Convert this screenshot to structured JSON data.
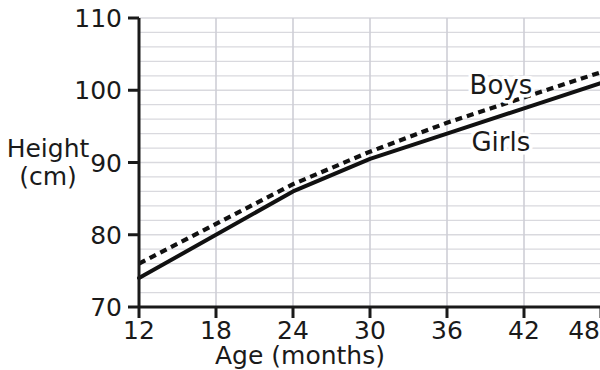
{
  "chart_data": {
    "type": "line",
    "title": "",
    "xlabel": "Age (months)",
    "ylabel_line1": "Height",
    "ylabel_line2": "(cm)",
    "x": [
      12,
      18,
      24,
      30,
      36,
      42,
      48
    ],
    "xticklabels": [
      "12",
      "18",
      "24",
      "30",
      "36",
      "42",
      "48"
    ],
    "yticklabels": [
      "70",
      "80",
      "90",
      "100",
      "110"
    ],
    "yticks": [
      70,
      80,
      90,
      100,
      110
    ],
    "xlim": [
      12,
      48
    ],
    "ylim": [
      70,
      110
    ],
    "grid": true,
    "grid_minor_y_step": 2,
    "grid_major_x_step": 6,
    "legend_position": "inline-annotation",
    "series": [
      {
        "name": "Boys",
        "style": "dashed",
        "color": "#111111",
        "values": [
          76,
          81.5,
          87,
          91.5,
          95.5,
          99,
          102.5
        ],
        "label_x": 40.2,
        "label_y": 99.5
      },
      {
        "name": "Girls",
        "style": "solid",
        "color": "#111111",
        "values": [
          74,
          80,
          86,
          90.5,
          94,
          97.5,
          101
        ],
        "label_x": 40.2,
        "label_y": 91.6
      }
    ],
    "colors": {
      "grid": "#d9d9de",
      "grid_vertical": "#cfcfd6",
      "axis": "#1a1a1a",
      "line": "#111111",
      "background": "#ffffff"
    }
  }
}
